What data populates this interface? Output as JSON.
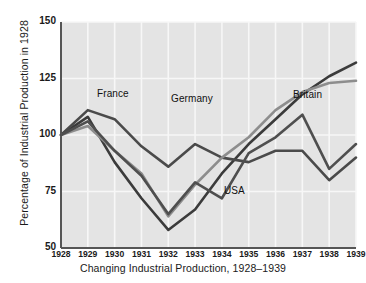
{
  "chart_data": {
    "type": "line",
    "title": "",
    "xlabel": "Changing Industrial Production, 1928–1939",
    "ylabel": "Percentage of Industrial Production in 1928",
    "x": [
      1928,
      1929,
      1930,
      1931,
      1932,
      1933,
      1934,
      1935,
      1936,
      1937,
      1938,
      1939
    ],
    "xtick_labels": [
      "1928",
      "1929",
      "1930",
      "1931",
      "1932",
      "1933",
      "1934",
      "1935",
      "1936",
      "1937",
      "1938",
      "1939"
    ],
    "ytick_labels": [
      "50",
      "75",
      "100",
      "125",
      "150"
    ],
    "ytick_values": [
      50,
      75,
      100,
      125,
      150
    ],
    "ylim": [
      50,
      150
    ],
    "xlim": [
      1928,
      1939
    ],
    "grid": true,
    "legend": "inline-labels",
    "series": [
      {
        "name": "Germany",
        "color": "#3b3b3b",
        "label_x": 171,
        "label_y": 93,
        "values": [
          100,
          108,
          88,
          72,
          58,
          67,
          83,
          96,
          107,
          118,
          126,
          132
        ]
      },
      {
        "name": "France",
        "color": "#4a4a4a",
        "label_x": 97,
        "label_y": 88,
        "values": [
          100,
          111,
          107,
          95,
          86,
          96,
          90,
          88,
          93,
          93,
          80,
          90
        ]
      },
      {
        "name": "Britain",
        "color": "#8d8d8d",
        "label_x": 293,
        "label_y": 89,
        "values": [
          100,
          104,
          93,
          83,
          64,
          78,
          90,
          99,
          111,
          119,
          123,
          124
        ]
      },
      {
        "name": "USA",
        "color": "#4f4f4f",
        "label_x": 224,
        "label_y": 185,
        "values": [
          100,
          106,
          93,
          82,
          65,
          79,
          72,
          92,
          99,
          109,
          85,
          96
        ]
      }
    ]
  }
}
